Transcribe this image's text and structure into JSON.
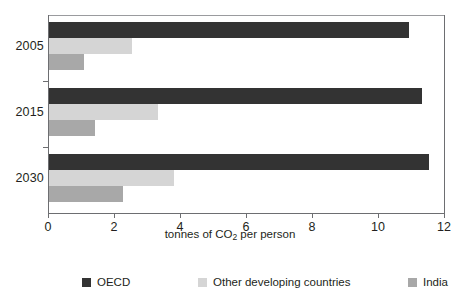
{
  "chart_data": {
    "type": "bar",
    "orientation": "horizontal",
    "title": "",
    "xlabel": "tonnes of CO2 per person",
    "xlabel_parts": {
      "pre": "tonnes of CO",
      "sub": "2",
      "post": " per person"
    },
    "ylabel": "",
    "categories": [
      "2005",
      "2015",
      "2030"
    ],
    "xticks": [
      "0",
      "2",
      "4",
      "6",
      "8",
      "10",
      "12"
    ],
    "xlim": [
      0,
      12
    ],
    "grid": false,
    "legend_position": "bottom",
    "series": [
      {
        "name": "OECD",
        "color": "#333333",
        "values": [
          10.9,
          11.3,
          11.5
        ]
      },
      {
        "name": "Other developing countries",
        "color": "#d5d5d5",
        "values": [
          2.5,
          3.3,
          3.8
        ]
      },
      {
        "name": "India",
        "color": "#a8a8a8",
        "values": [
          1.05,
          1.4,
          2.25
        ]
      }
    ]
  },
  "legend": {
    "items": [
      {
        "label": "OECD",
        "color": "#333333"
      },
      {
        "label": "Other developing countries",
        "color": "#d5d5d5"
      },
      {
        "label": "India",
        "color": "#a8a8a8"
      }
    ]
  }
}
